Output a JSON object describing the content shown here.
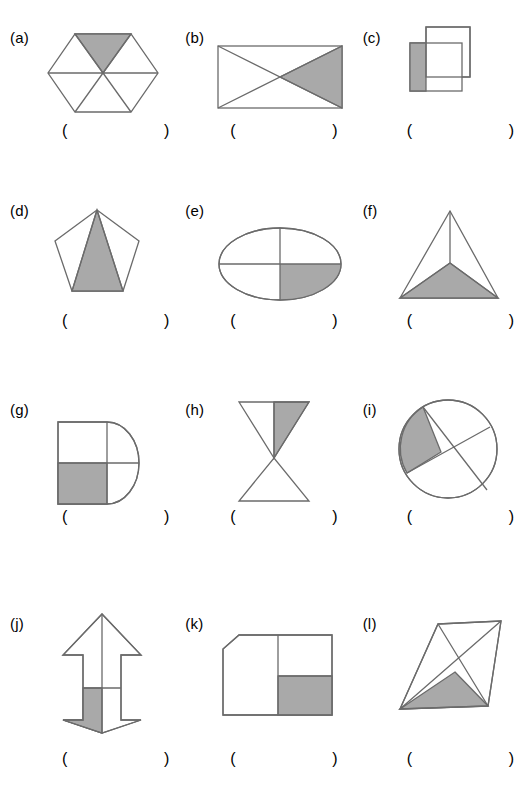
{
  "worksheet": {
    "title": "",
    "colors": {
      "shade": "#a9a9a9",
      "stroke": "#6b6b6b",
      "background": "#ffffff",
      "text": "#000000"
    },
    "answer_blank": "(      )",
    "items": [
      {
        "label": "(a)",
        "shape_name": "hexagon-six-triangles",
        "description": "Regular hexagon divided into six triangles by lines from each vertex to the center",
        "shaded_parts": 1,
        "total_parts": 6,
        "shaded_fraction": "1/6",
        "answer": "(      )"
      },
      {
        "label": "(b)",
        "shape_name": "rectangle-two-diagonals",
        "description": "Rectangle divided into four triangles by both diagonals",
        "shaded_parts": 1,
        "total_parts": 4,
        "shaded_fraction": "1/4",
        "answer": "(      )"
      },
      {
        "label": "(c)",
        "shape_name": "two-overlapping-squares",
        "description": "Two overlapping squares, left strip of lower-left square shaded",
        "shaded_parts": 1,
        "total_parts": 4,
        "shaded_fraction": "1/4",
        "answer": "(      )"
      },
      {
        "label": "(d)",
        "shape_name": "pentagon-three-triangles",
        "description": "Regular pentagon divided into three triangles from the top vertex",
        "shaded_parts": 1,
        "total_parts": 3,
        "shaded_fraction": "1/3",
        "answer": "(      )"
      },
      {
        "label": "(e)",
        "shape_name": "ellipse-quartered",
        "description": "Ellipse divided into four parts by a vertical and a horizontal line",
        "shaded_parts": 1,
        "total_parts": 4,
        "shaded_fraction": "1/4",
        "answer": "(      )"
      },
      {
        "label": "(f)",
        "shape_name": "triangle-three-parts",
        "description": "Triangle divided into three parts from an interior point",
        "shaded_parts": 1,
        "total_parts": 3,
        "shaded_fraction": "1/3",
        "answer": "(      )"
      },
      {
        "label": "(g)",
        "shape_name": "square-semicircle-quartered",
        "description": "Square with a semicircle on the right, divided into four parts",
        "shaded_parts": 1,
        "total_parts": 4,
        "shaded_fraction": "1/4",
        "answer": "(      )"
      },
      {
        "label": "(h)",
        "shape_name": "hourglass-two-triangles",
        "description": "Hourglass of two triangles, upper triangle split in half, right half shaded",
        "shaded_parts": 1,
        "total_parts": 3,
        "shaded_fraction": "1/3",
        "answer": "(      )"
      },
      {
        "label": "(i)",
        "shape_name": "circle-two-chords",
        "description": "Circle divided into four parts by two crossing chords, left wedge shaded",
        "shaded_parts": 1,
        "total_parts": 4,
        "shaded_fraction": "1/4",
        "answer": "(      )"
      },
      {
        "label": "(j)",
        "shape_name": "double-headed-arrow-quartered",
        "description": "Vertical double-headed arrow divided into four parts, lower-left shaded",
        "shaded_parts": 1,
        "total_parts": 4,
        "shaded_fraction": "1/4",
        "answer": "(      )"
      },
      {
        "label": "(k)",
        "shape_name": "clipped-square-parts",
        "description": "Square with chamfered top-left corner, right half split, bottom-right shaded",
        "shaded_parts": 1,
        "total_parts": 3,
        "shaded_fraction": "1/3",
        "answer": "(      )"
      },
      {
        "label": "(l)",
        "shape_name": "quadrilateral-two-diagonals",
        "description": "Slanted quadrilateral with both diagonals, bottom triangle shaded",
        "shaded_parts": 1,
        "total_parts": 4,
        "shaded_fraction": "1/4",
        "answer": "(      )"
      }
    ]
  }
}
